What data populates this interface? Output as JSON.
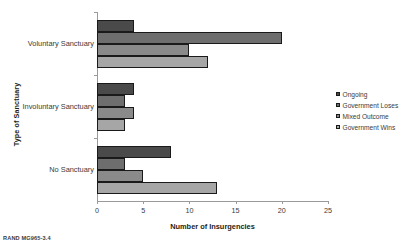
{
  "figure": {
    "footer_note": "RAND MG965-3.4"
  },
  "chart_data": {
    "type": "bar",
    "orientation": "horizontal",
    "title": "",
    "xlabel": "Number of Insurgencies",
    "ylabel": "Type of Sanctuary",
    "categories": [
      "Voluntary Sanctuary",
      "Involuntary Sanctuary",
      "No Sanctuary"
    ],
    "series": [
      {
        "name": "Ongoing",
        "color": "#4a4a4a",
        "values": [
          4,
          4,
          8
        ]
      },
      {
        "name": "Government Loses",
        "color": "#6e6e6e",
        "values": [
          20,
          3,
          3
        ]
      },
      {
        "name": "Mixed Outcome",
        "color": "#8a8a8a",
        "values": [
          10,
          4,
          5
        ]
      },
      {
        "name": "Government Wins",
        "color": "#a6a6a6",
        "values": [
          12,
          3,
          13
        ]
      }
    ],
    "xlim": [
      0,
      25
    ],
    "xticks": [
      0,
      5,
      10,
      15,
      20,
      25
    ],
    "xtick_labels": [
      "0",
      "5",
      "10",
      "15",
      "20",
      "25"
    ],
    "grid": false,
    "legend_position": "right"
  }
}
